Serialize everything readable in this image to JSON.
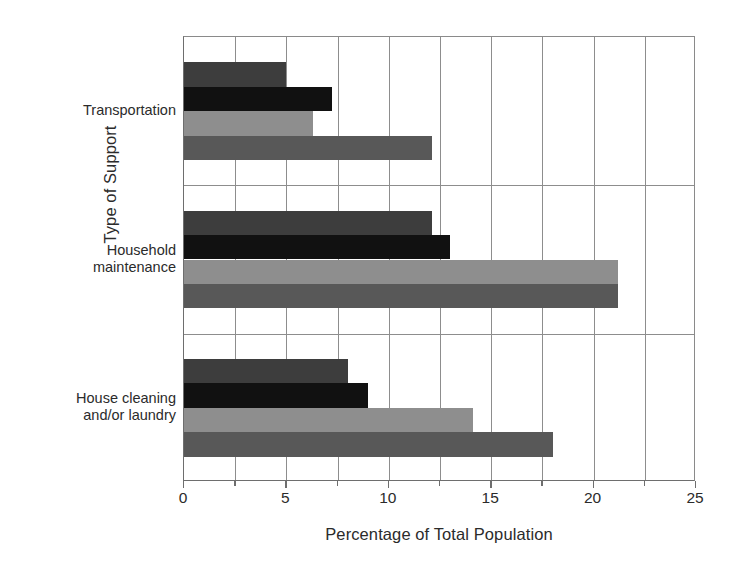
{
  "chart_data": {
    "type": "bar",
    "orientation": "horizontal",
    "title": "",
    "xlabel": "Percentage of Total Population",
    "ylabel": "Type of Support",
    "categories": [
      "Transportation",
      "Household maintenance",
      "House cleaning and/or laundry"
    ],
    "category_label_lines": [
      [
        "Transportation"
      ],
      [
        "Household",
        "maintenance"
      ],
      [
        "House cleaning",
        "and/or laundry"
      ]
    ],
    "series": [
      {
        "name": "series-1",
        "color": "#3d3d3d",
        "values": [
          5.0,
          12.1,
          8.0
        ]
      },
      {
        "name": "series-2",
        "color": "#111111",
        "values": [
          7.2,
          13.0,
          9.0
        ]
      },
      {
        "name": "series-3",
        "color": "#8e8e8e",
        "values": [
          6.3,
          21.2,
          14.1
        ]
      },
      {
        "name": "series-4",
        "color": "#585858",
        "values": [
          12.1,
          21.2,
          18.0
        ]
      }
    ],
    "xlim": [
      0,
      25
    ],
    "x_major_ticks": [
      0,
      5,
      10,
      15,
      20,
      25
    ],
    "x_tick_labels": [
      "0",
      "5",
      "10",
      "15",
      "20",
      "25"
    ],
    "x_minor_gridlines": [
      2.5,
      7.5,
      12.5,
      17.5,
      22.5
    ],
    "grid": true,
    "legend": "none",
    "gridline_color": "#8d8d8d",
    "axis_color": "#6e6e6e",
    "background": "#ffffff"
  }
}
